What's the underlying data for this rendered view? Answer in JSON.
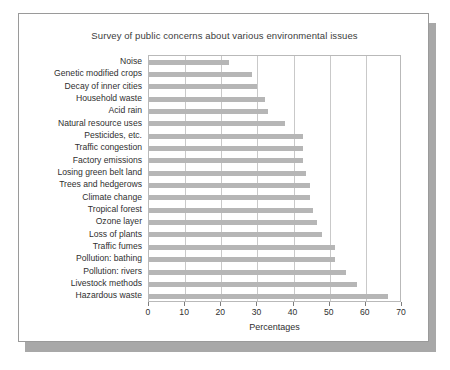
{
  "card": {
    "title": "Survey of public concerns about various environmental issues"
  },
  "chart_data": {
    "type": "bar",
    "orientation": "horizontal",
    "title": "Survey of public concerns about various environmental issues",
    "xlabel": "Percentages",
    "ylabel": "",
    "xlim": [
      0,
      70
    ],
    "xticks": [
      0,
      10,
      20,
      30,
      40,
      50,
      60,
      70
    ],
    "grid": "vertical",
    "legend": "none",
    "bar_color": "#b6b6b6",
    "categories": [
      "Noise",
      "Genetic modified crops",
      "Decay of inner cities",
      "Household waste",
      "Acid rain",
      "Natural resource uses",
      "Pesticides, etc.",
      "Traffic congestion",
      "Factory emissions",
      "Losing green belt land",
      "Trees and hedgerows",
      "Climate change",
      "Tropical forest",
      "Ozone layer",
      "Loss of plants",
      "Traffic fumes",
      "Pollution: bathing",
      "Pollution: rivers",
      "Livestock methods",
      "Hazardous waste"
    ],
    "values": [
      22,
      28.5,
      30,
      32,
      33,
      37.5,
      42.5,
      42.5,
      42.5,
      43.5,
      44.5,
      44.5,
      45.5,
      46.5,
      48,
      51.5,
      51.5,
      54.5,
      57.5,
      66
    ]
  }
}
